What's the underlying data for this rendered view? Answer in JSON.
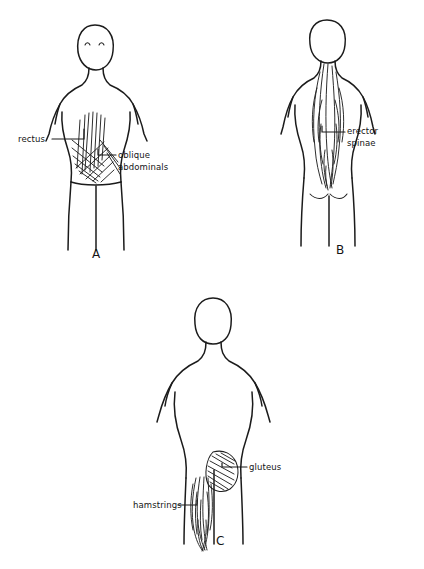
{
  "document": {
    "title": "Core and posterior chain muscle groups",
    "style": "hand-drawn pen sketch",
    "background_color": "#ffffff",
    "ink_color": "#1b1b1b"
  },
  "panels": [
    {
      "id": "panel-a",
      "letter": "A",
      "view": "anterior",
      "figure": "female torso front view, head with two eyes, arms at sides, legs",
      "labels": [
        {
          "id": "rectus",
          "text": "rectus",
          "text_x": 18,
          "text_y": 142,
          "leader": "M 52 139 L 84 139 L 84 129"
        },
        {
          "id": "oblique-abdominals",
          "text_line1": "oblique",
          "text_line2": "abdominals",
          "text_x": 118,
          "text_y": 158,
          "text2_y": 170,
          "leader": "M 116 155 L 98 155 L 98 149"
        }
      ],
      "muscles": [
        "rectus abdominis vertical striations",
        "external oblique cross hatching"
      ]
    },
    {
      "id": "panel-b",
      "letter": "B",
      "view": "posterior upper",
      "figure": "female torso back view, head, shoulders, gluteal folds, legs",
      "labels": [
        {
          "id": "erector-spinae",
          "text_line1": "erector",
          "text_line2": "spinae",
          "text_x": 347,
          "text_y": 134,
          "text2_y": 146,
          "leader": "M 345 132 L 322 132 L 322 126"
        }
      ],
      "muscles": [
        "erector spinae long vertical spindles along spine"
      ]
    },
    {
      "id": "panel-c",
      "letter": "C",
      "view": "posterior lower",
      "figure": "female torso back view, head without face, arms, legs",
      "labels": [
        {
          "id": "gluteus",
          "text": "gluteus",
          "text_x": 249,
          "text_y": 470,
          "leader": "M 247 467 L 222 467 L 222 463"
        },
        {
          "id": "hamstrings",
          "text": "hamstrings",
          "text_x": 133,
          "text_y": 508,
          "leader": "M 178 505 L 197 505 L 197 500"
        }
      ],
      "muscles": [
        "gluteus maximus diagonal hatched fan",
        "hamstrings vertical spindles on thigh"
      ]
    }
  ]
}
